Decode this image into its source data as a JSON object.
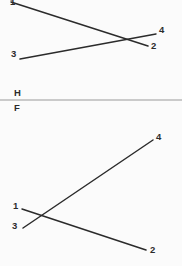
{
  "figure": {
    "background_color": "#fbfbfb",
    "line_color": "#2b2b2b",
    "fold_line_color": "#9a9a9a",
    "top_view_name": "horizontal-projection",
    "front_view_name": "frontal-projection"
  },
  "fold_line": {
    "above_label": "H",
    "below_label": "F"
  },
  "top_view": {
    "labels": {
      "p1": "1",
      "p2": "2",
      "p3": "3",
      "p4": "4"
    }
  },
  "front_view": {
    "labels": {
      "p1": "1",
      "p2": "2",
      "p3": "3",
      "p4": "4"
    }
  },
  "chart_data": {
    "type": "scatter",
    "title": "",
    "subtitle": "",
    "xlabel": "",
    "ylabel": "",
    "xlim": [
      0,
      182
    ],
    "ylim": [
      266,
      0
    ],
    "grid": false,
    "legend": "none",
    "annotations": [
      "H",
      "F",
      "1",
      "2",
      "3",
      "4",
      "1",
      "2",
      "3",
      "4"
    ],
    "series": [
      {
        "name": "line-1-2-top-view",
        "view": "horizontal",
        "x": [
          11,
          148
        ],
        "y": [
          2,
          46
        ],
        "endpoint_labels": [
          "1",
          "2"
        ]
      },
      {
        "name": "line-3-4-top-view",
        "view": "horizontal",
        "x": [
          20,
          156
        ],
        "y": [
          59,
          34
        ],
        "endpoint_labels": [
          "3",
          "4"
        ]
      },
      {
        "name": "fold-line-HF",
        "view": "fold",
        "x": [
          0,
          182
        ],
        "y": [
          100,
          100
        ],
        "endpoint_labels": [
          "",
          ""
        ]
      },
      {
        "name": "line-1-2-front-view",
        "view": "frontal",
        "x": [
          22,
          146
        ],
        "y": [
          209,
          250
        ],
        "endpoint_labels": [
          "1",
          "2"
        ]
      },
      {
        "name": "line-3-4-front-view",
        "view": "frontal",
        "x": [
          23,
          153
        ],
        "y": [
          228,
          140
        ],
        "endpoint_labels": [
          "3",
          "4"
        ]
      }
    ],
    "intersections": [
      {
        "name": "top-view-crossing",
        "x": 128,
        "y": 40
      },
      {
        "name": "front-view-crossing",
        "x": 41,
        "y": 217
      }
    ]
  },
  "footer": {
    "clipped_text": ""
  }
}
